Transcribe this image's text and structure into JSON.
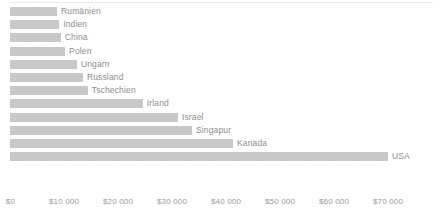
{
  "chart_data": {
    "type": "bar",
    "orientation": "horizontal",
    "title": "",
    "subtitle": "",
    "xlabel": "",
    "ylabel": "",
    "grid": false,
    "legend": false,
    "legend_position": "none",
    "xlim": [
      0,
      70000
    ],
    "categories": [
      "Rumänien",
      "Indien",
      "China",
      "Polen",
      "Ungarn",
      "Russland",
      "Tschechien",
      "Irland",
      "Israel",
      "Singapur",
      "Kanada",
      "USA"
    ],
    "values": [
      8700,
      9100,
      9400,
      10200,
      12400,
      13500,
      14400,
      24600,
      31100,
      33700,
      41300,
      70000
    ],
    "value_prefix": "$",
    "tick_labels": [
      "$0",
      "$10 000",
      "$20 000",
      "$30 000",
      "$40 000",
      "$50 000",
      "$60 000",
      "$70 000"
    ],
    "tick_values": [
      0,
      10000,
      20000,
      30000,
      40000,
      50000,
      60000,
      70000
    ],
    "colors": {
      "bar_fill": "#cfcfcf",
      "bar_pattern": "#bdbdbd",
      "label_text": "#8d8d8d",
      "tick_text": "#9a9a9a",
      "rule": "#e9e9e9",
      "background": "#ffffff"
    }
  }
}
